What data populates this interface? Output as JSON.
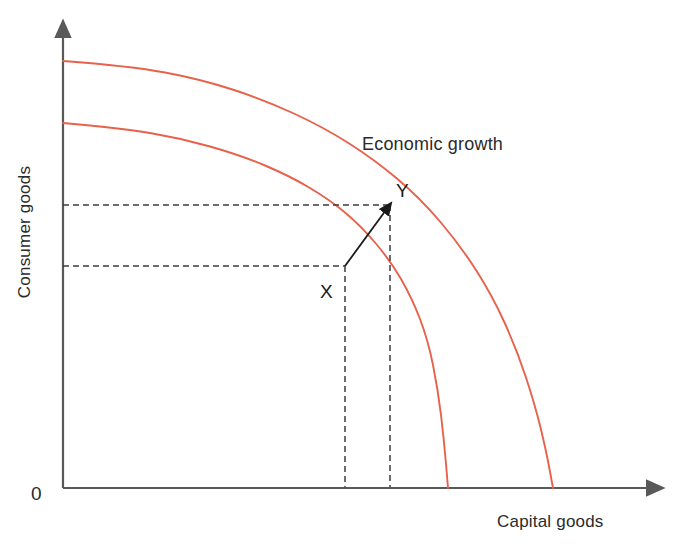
{
  "figure": {
    "type": "production-possibility-frontier",
    "cropped_top_line": "",
    "origin_label": "0",
    "axes": {
      "y_label": "Consumer goods",
      "x_label": "Capital goods",
      "axis_color": "#595959"
    },
    "annotations": {
      "growth_label": "Economic growth",
      "point_x_label": "X",
      "point_y_label": "Y"
    },
    "colors": {
      "curve": "#e8614b",
      "axis": "#595959",
      "dashed": "#3c3c3c",
      "arrow": "#1a1a1a",
      "text": "#2b2b2b",
      "background": "#ffffff"
    }
  },
  "chart_data": {
    "type": "line",
    "title": "",
    "xlabel": "Capital goods",
    "ylabel": "Consumer goods",
    "grid": false,
    "legend": "none",
    "xlim": [
      0,
      1
    ],
    "ylim": [
      0,
      1
    ],
    "axis_ticks": {
      "x": [],
      "y": []
    },
    "series": [
      {
        "name": "Original PPF",
        "kind": "ppf-curve",
        "color": "#e8614b",
        "y_intercept_px": 123,
        "x_intercept_px": 448,
        "path_points_px": [
          [
            63,
            123
          ],
          [
            120,
            128
          ],
          [
            180,
            138
          ],
          [
            240,
            155
          ],
          [
            290,
            176
          ],
          [
            330,
            200
          ],
          [
            360,
            225
          ],
          [
            390,
            260
          ],
          [
            412,
            298
          ],
          [
            428,
            340
          ],
          [
            438,
            390
          ],
          [
            444,
            440
          ],
          [
            448,
            488
          ]
        ]
      },
      {
        "name": "Expanded PPF after economic growth",
        "kind": "ppf-curve",
        "color": "#e8614b",
        "y_intercept_px": 61,
        "x_intercept_px": 553,
        "path_points_px": [
          [
            63,
            61
          ],
          [
            130,
            66
          ],
          [
            200,
            79
          ],
          [
            265,
            100
          ],
          [
            325,
            128
          ],
          [
            375,
            160
          ],
          [
            420,
            198
          ],
          [
            460,
            245
          ],
          [
            492,
            295
          ],
          [
            517,
            350
          ],
          [
            535,
            405
          ],
          [
            546,
            450
          ],
          [
            553,
            488
          ]
        ]
      }
    ],
    "points": [
      {
        "label": "X",
        "on_series": "Original PPF",
        "px": [
          345,
          266
        ],
        "label_px": [
          320,
          298
        ],
        "projections": [
          "horizontal-to-y-axis",
          "vertical-to-x-axis"
        ]
      },
      {
        "label": "Y",
        "on_series": "Expanded PPF after economic growth",
        "px": [
          390,
          205
        ],
        "label_px": [
          396,
          197
        ],
        "projections": [
          "horizontal-to-y-axis",
          "vertical-to-x-axis"
        ]
      }
    ],
    "arrows": [
      {
        "name": "growth-arrow",
        "from_px": [
          345,
          266
        ],
        "to_px": [
          388,
          207
        ],
        "meaning": "Economic growth"
      }
    ],
    "dashed_guides": [
      {
        "orientation": "horizontal",
        "y_px": 205,
        "x_from_px": 63,
        "x_to_px": 390
      },
      {
        "orientation": "horizontal",
        "y_px": 266,
        "x_from_px": 63,
        "x_to_px": 345
      },
      {
        "orientation": "vertical",
        "x_px": 345,
        "y_from_px": 266,
        "y_to_px": 488
      },
      {
        "orientation": "vertical",
        "x_px": 390,
        "y_from_px": 205,
        "y_to_px": 488
      }
    ],
    "annotation_text": "Economic growth",
    "annotation_px": [
      362,
      150
    ]
  }
}
